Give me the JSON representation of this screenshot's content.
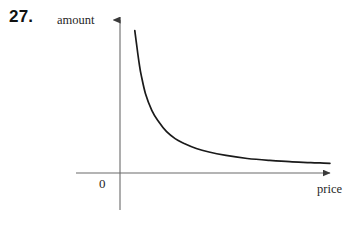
{
  "figure": {
    "problem_number": "27.",
    "axis_y_label": "amount",
    "axis_x_label": "price",
    "origin_label": "0",
    "curve_color": "#1a1a1a",
    "axis_color": "#555555",
    "background_color": "#ffffff"
  },
  "chart_data": {
    "type": "line",
    "title": "",
    "subtitle": "",
    "xlabel": "price",
    "ylabel": "amount",
    "annotations": [
      "27.",
      "0"
    ],
    "legend": [],
    "legend_position": "none",
    "grid": false,
    "axis_arrows": true,
    "xlim": [
      0,
      10
    ],
    "ylim": [
      0,
      10
    ],
    "xticks": [],
    "yticks": [],
    "xticklabels": [],
    "yticklabels": [],
    "series": [
      {
        "name": "demand curve",
        "description": "decreasing convex curve (hyperbola-like), amount falls steeply then flattens as price rises",
        "x": [
          0.7,
          0.8,
          0.9,
          1.0,
          1.2,
          1.5,
          1.8,
          2.2,
          2.6,
          3.0,
          3.6,
          4.2,
          5.0,
          6.0,
          7.0,
          8.0,
          9.0,
          9.9
        ],
        "y": [
          9.3,
          8.2,
          7.2,
          6.4,
          5.2,
          4.1,
          3.4,
          2.7,
          2.25,
          1.95,
          1.6,
          1.37,
          1.15,
          0.95,
          0.83,
          0.74,
          0.68,
          0.63
        ]
      }
    ]
  }
}
